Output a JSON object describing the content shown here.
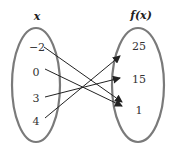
{
  "domain_header": {
    "left": "x",
    "right": "f(x)"
  },
  "domain_values": [
    "−2",
    "0",
    "3",
    "4"
  ],
  "range_values": [
    "25",
    "15",
    "1"
  ],
  "mappings": [
    {
      "from": "−2",
      "to": "1"
    },
    {
      "from": "0",
      "to": "1"
    },
    {
      "from": "3",
      "to": "15"
    },
    {
      "from": "4",
      "to": "25"
    }
  ],
  "colors": {
    "ellipse": "#7a7a7a",
    "arrow": "#222222",
    "text": "#333333"
  }
}
